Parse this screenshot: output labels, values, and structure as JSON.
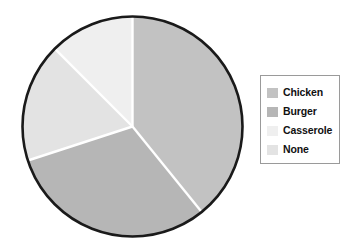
{
  "chart_data": {
    "type": "pie",
    "title": "",
    "subtitle": "",
    "xlabel": "",
    "ylabel": "",
    "grid": false,
    "legend_position": "right",
    "start_angle_deg": 0,
    "direction": "clockwise",
    "center": {
      "x": 132.5,
      "y": 126.5
    },
    "radius": 110,
    "outline_color": "#1a1a1a",
    "separator_color": "#ffffff",
    "labels": [
      "Chicken",
      "Burger",
      "Casserole",
      "None"
    ],
    "values": [
      39.2,
      30.8,
      12.5,
      17.5
    ],
    "units": "percent",
    "slices": [
      {
        "label": "Chicken",
        "value": 39.2,
        "color": "#c2c2c2",
        "start_angle_deg": 0,
        "end_angle_deg": 141
      },
      {
        "label": "Burger",
        "value": 30.8,
        "color": "#b6b6b6",
        "start_angle_deg": 141,
        "end_angle_deg": 252
      },
      {
        "label": "Casserole",
        "value": 12.5,
        "color": "#efefef",
        "start_angle_deg": 315,
        "end_angle_deg": 360
      },
      {
        "label": "None",
        "value": 17.5,
        "color": "#e3e3e3",
        "start_angle_deg": 252,
        "end_angle_deg": 315
      }
    ]
  },
  "legend": {
    "entries": [
      {
        "label": "Chicken",
        "color": "#c2c2c2"
      },
      {
        "label": "Burger",
        "color": "#b6b6b6"
      },
      {
        "label": "Casserole",
        "color": "#efefef"
      },
      {
        "label": "None",
        "color": "#e3e3e3"
      }
    ],
    "border_color": "#9a9a9a",
    "background": "#ffffff"
  }
}
